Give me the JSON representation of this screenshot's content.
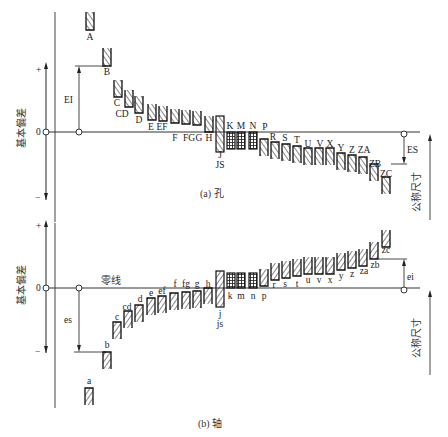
{
  "left_axis": {
    "label": "基本偏差",
    "plus": "+",
    "zero": "0",
    "minus": "−"
  },
  "holes": {
    "caption": "(a) 孔",
    "zero_line_y": 132,
    "ei_label": "EI",
    "es_label": "ES",
    "nominal_label": "公称尺寸",
    "letters": [
      {
        "name": "A",
        "x": 90,
        "top": 12,
        "bot": 30,
        "lx": 90,
        "ly": 40
      },
      {
        "name": "B",
        "x": 107,
        "top": 48,
        "bot": 66,
        "lx": 107,
        "ly": 75
      },
      {
        "name": "C",
        "x": 118,
        "top": 80,
        "bot": 97,
        "lx": 117,
        "ly": 106
      },
      {
        "name": "CD",
        "x": 129,
        "top": 90,
        "bot": 107,
        "lx": 122,
        "ly": 117
      },
      {
        "name": "D",
        "x": 139,
        "top": 96,
        "bot": 113,
        "lx": 139,
        "ly": 123
      },
      {
        "name": "E",
        "x": 152,
        "top": 104,
        "bot": 120,
        "lx": 151,
        "ly": 130
      },
      {
        "name": "EF",
        "x": 163,
        "top": 106,
        "bot": 121,
        "lx": 162,
        "ly": 130
      },
      {
        "name": "F",
        "x": 175,
        "top": 109,
        "bot": 123,
        "lx": 175,
        "ly": 141
      },
      {
        "name": "FG",
        "x": 186,
        "top": 110,
        "bot": 124,
        "lx": 189,
        "ly": 141
      },
      {
        "name": "G",
        "x": 197,
        "top": 111,
        "bot": 125,
        "lx": 199,
        "ly": 141
      },
      {
        "name": "H",
        "x": 209,
        "top": 116,
        "bot": 132,
        "lx": 209,
        "ly": 141
      }
    ],
    "js": {
      "name": "J",
      "name2": "JS",
      "x": 220,
      "top": 116,
      "bot": 152,
      "lx": 220,
      "ly": 158,
      "ly2": 168
    },
    "kmn": [
      {
        "name": "K",
        "x": 231,
        "lx": 230,
        "ly": 129
      },
      {
        "name": "M",
        "x": 241,
        "lx": 241,
        "ly": 129
      },
      {
        "name": "N",
        "x": 253,
        "lx": 253,
        "ly": 129
      }
    ],
    "letters_low": [
      {
        "name": "P",
        "x": 264,
        "top": 139,
        "bot": 156,
        "lx": 265,
        "ly": 130
      },
      {
        "name": "R",
        "x": 275,
        "top": 142,
        "bot": 159,
        "lx": 273,
        "ly": 140
      },
      {
        "name": "S",
        "x": 286,
        "top": 144,
        "bot": 161,
        "lx": 285,
        "ly": 141
      },
      {
        "name": "T",
        "x": 297,
        "top": 146,
        "bot": 163,
        "lx": 297,
        "ly": 143
      },
      {
        "name": "U",
        "x": 308,
        "top": 148,
        "bot": 165,
        "lx": 308,
        "ly": 147
      },
      {
        "name": "V",
        "x": 319,
        "top": 148,
        "bot": 165,
        "lx": 320,
        "ly": 147
      },
      {
        "name": "X",
        "x": 330,
        "top": 148,
        "bot": 165,
        "lx": 330,
        "ly": 147
      },
      {
        "name": "Y",
        "x": 341,
        "top": 153,
        "bot": 170,
        "lx": 341,
        "ly": 151
      },
      {
        "name": "Z",
        "x": 352,
        "top": 155,
        "bot": 172,
        "lx": 352,
        "ly": 153
      },
      {
        "name": "ZA",
        "x": 363,
        "top": 157,
        "bot": 174,
        "lx": 364,
        "ly": 153
      },
      {
        "name": "ZB",
        "x": 374,
        "top": 164,
        "bot": 181,
        "lx": 375,
        "ly": 167
      },
      {
        "name": "ZC",
        "x": 386,
        "top": 177,
        "bot": 194,
        "lx": 386,
        "ly": 177
      }
    ]
  },
  "shafts": {
    "caption": "(b) 轴",
    "zero_line_y": 288,
    "zero_line_label": "零线",
    "es_label": "es",
    "ei_label": "ei",
    "nominal_label": "公称尺寸",
    "letters": [
      {
        "name": "a",
        "x": 89,
        "top": 388,
        "bot": 405,
        "lx": 89,
        "ly": 384
      },
      {
        "name": "b",
        "x": 107,
        "top": 352,
        "bot": 369,
        "lx": 107,
        "ly": 348
      },
      {
        "name": "c",
        "x": 117,
        "top": 322,
        "bot": 339,
        "lx": 117,
        "ly": 320
      },
      {
        "name": "cd",
        "x": 128,
        "top": 311,
        "bot": 328,
        "lx": 127,
        "ly": 310
      },
      {
        "name": "d",
        "x": 139,
        "top": 305,
        "bot": 322,
        "lx": 140,
        "ly": 302
      },
      {
        "name": "e",
        "x": 151,
        "top": 298,
        "bot": 315,
        "lx": 151,
        "ly": 296
      },
      {
        "name": "ef",
        "x": 162,
        "top": 296,
        "bot": 313,
        "lx": 162,
        "ly": 294
      },
      {
        "name": "f",
        "x": 174,
        "top": 293,
        "bot": 310,
        "lx": 175,
        "ly": 287
      },
      {
        "name": "fg",
        "x": 186,
        "top": 292,
        "bot": 309,
        "lx": 186,
        "ly": 287
      },
      {
        "name": "g",
        "x": 197,
        "top": 291,
        "bot": 308,
        "lx": 197,
        "ly": 287
      },
      {
        "name": "h",
        "x": 208,
        "top": 288,
        "bot": 304,
        "lx": 208,
        "ly": 287
      }
    ],
    "js": {
      "name": "j",
      "name2": "js",
      "x": 220,
      "top": 271,
      "bot": 307,
      "lx": 220,
      "ly": 317,
      "ly2": 327
    },
    "kmn": [
      {
        "name": "k",
        "x": 231,
        "lx": 230,
        "ly": 299
      },
      {
        "name": "m",
        "x": 241,
        "lx": 241,
        "ly": 299
      },
      {
        "name": "n",
        "x": 253,
        "lx": 253,
        "ly": 299
      }
    ],
    "letters_high": [
      {
        "name": "p",
        "x": 264,
        "top": 269,
        "bot": 286,
        "lx": 264,
        "ly": 299
      },
      {
        "name": "r",
        "x": 275,
        "top": 263,
        "bot": 280,
        "lx": 274,
        "ly": 288
      },
      {
        "name": "s",
        "x": 286,
        "top": 261,
        "bot": 278,
        "lx": 285,
        "ly": 287
      },
      {
        "name": "t",
        "x": 297,
        "top": 259,
        "bot": 276,
        "lx": 297,
        "ly": 287
      },
      {
        "name": "u",
        "x": 308,
        "top": 257,
        "bot": 274,
        "lx": 308,
        "ly": 283
      },
      {
        "name": "v",
        "x": 319,
        "top": 257,
        "bot": 274,
        "lx": 319,
        "ly": 283
      },
      {
        "name": "x",
        "x": 330,
        "top": 257,
        "bot": 274,
        "lx": 330,
        "ly": 283
      },
      {
        "name": "y",
        "x": 341,
        "top": 253,
        "bot": 270,
        "lx": 341,
        "ly": 279
      },
      {
        "name": "z",
        "x": 352,
        "top": 251,
        "bot": 268,
        "lx": 352,
        "ly": 277
      },
      {
        "name": "za",
        "x": 363,
        "top": 249,
        "bot": 266,
        "lx": 364,
        "ly": 274
      },
      {
        "name": "zb",
        "x": 374,
        "top": 242,
        "bot": 259,
        "lx": 375,
        "ly": 268
      },
      {
        "name": "zc",
        "x": 386,
        "top": 230,
        "bot": 247,
        "lx": 386,
        "ly": 253
      }
    ]
  }
}
